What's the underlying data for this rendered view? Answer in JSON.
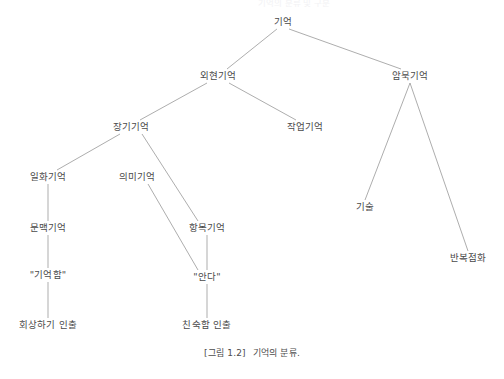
{
  "figure": {
    "caption_number": "[그림 1.2]",
    "caption_text": "기억의 분류.",
    "cropped_header_text": "기억의 분류 및 구분"
  },
  "diagram": {
    "type": "tree",
    "line_color": "#8a8a8a",
    "text_color": "#4a4a4a",
    "background": "#ffffff",
    "nodes": [
      {
        "id": "memory",
        "label": "기억",
        "x": 283,
        "y": 22
      },
      {
        "id": "explicit",
        "label": "외현기억",
        "x": 218,
        "y": 76
      },
      {
        "id": "implicit",
        "label": "암묵기억",
        "x": 410,
        "y": 76
      },
      {
        "id": "longterm",
        "label": "장기기억",
        "x": 131,
        "y": 127
      },
      {
        "id": "working",
        "label": "작업기억",
        "x": 305,
        "y": 127
      },
      {
        "id": "episodic",
        "label": "일화기억",
        "x": 48,
        "y": 177
      },
      {
        "id": "semantic",
        "label": "의미기억",
        "x": 137,
        "y": 177
      },
      {
        "id": "context",
        "label": "문맥기억",
        "x": 48,
        "y": 228
      },
      {
        "id": "item",
        "label": "항목기억",
        "x": 207,
        "y": 228
      },
      {
        "id": "remember",
        "label": "\"기억함\"",
        "x": 48,
        "y": 275
      },
      {
        "id": "know",
        "label": "\"안다\"",
        "x": 207,
        "y": 277
      },
      {
        "id": "recollection",
        "label": "회상하기 인출",
        "x": 48,
        "y": 325
      },
      {
        "id": "familiarity",
        "label": "친숙함 인출",
        "x": 207,
        "y": 325
      },
      {
        "id": "skill",
        "label": "기술",
        "x": 365,
        "y": 207
      },
      {
        "id": "priming",
        "label": "반복점화",
        "x": 468,
        "y": 258
      }
    ],
    "edges": [
      {
        "from": "memory",
        "to": "explicit"
      },
      {
        "from": "memory",
        "to": "implicit"
      },
      {
        "from": "explicit",
        "to": "longterm"
      },
      {
        "from": "explicit",
        "to": "working"
      },
      {
        "from": "longterm",
        "to": "episodic"
      },
      {
        "from": "longterm",
        "to": "item"
      },
      {
        "from": "episodic",
        "to": "context"
      },
      {
        "from": "context",
        "to": "remember"
      },
      {
        "from": "remember",
        "to": "recollection"
      },
      {
        "from": "semantic",
        "to": "know"
      },
      {
        "from": "item",
        "to": "know"
      },
      {
        "from": "know",
        "to": "familiarity"
      },
      {
        "from": "implicit",
        "to": "skill"
      },
      {
        "from": "implicit",
        "to": "priming"
      }
    ]
  }
}
